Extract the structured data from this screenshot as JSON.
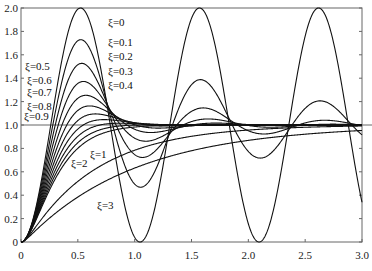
{
  "chart_data": {
    "type": "line",
    "title": "",
    "xlabel": "",
    "ylabel": "",
    "xlim": [
      0,
      3.0
    ],
    "ylim": [
      0,
      2.0
    ],
    "grid": false,
    "legend": "none (inline annotations)",
    "x_ticks": [
      "0",
      "0.5",
      "1.0",
      "1.5",
      "2.0",
      "2.5",
      "3.0"
    ],
    "y_ticks": [
      "0",
      "0.2",
      "0.4",
      "0.6",
      "0.8",
      "1.0",
      "1.2",
      "1.4",
      "1.6",
      "1.8",
      "2.0"
    ],
    "reference_line": {
      "y": 1.0
    },
    "model": "unit step response of second-order system, natural frequency approx 6 rad/s",
    "omega_n": 6.0,
    "series": [
      {
        "name": "ξ=0",
        "zeta": 0,
        "peak": 2.0,
        "label": "ξ=0"
      },
      {
        "name": "ξ=0.1",
        "zeta": 0.1,
        "peak": 1.73,
        "label": "ξ=0.1"
      },
      {
        "name": "ξ=0.2",
        "zeta": 0.2,
        "peak": 1.53,
        "label": "ξ=0.2"
      },
      {
        "name": "ξ=0.3",
        "zeta": 0.3,
        "peak": 1.37,
        "label": "ξ=0.3"
      },
      {
        "name": "ξ=0.4",
        "zeta": 0.4,
        "peak": 1.25,
        "label": "ξ=0.4"
      },
      {
        "name": "ξ=0.5",
        "zeta": 0.5,
        "peak": 1.16,
        "label": "ξ=0.5"
      },
      {
        "name": "ξ=0.6",
        "zeta": 0.6,
        "peak": 1.09,
        "label": "ξ=0.6"
      },
      {
        "name": "ξ=0.7",
        "zeta": 0.7,
        "peak": 1.05,
        "label": "ξ=0.7"
      },
      {
        "name": "ξ=0.8",
        "zeta": 0.8,
        "peak": 1.02,
        "label": "ξ=0.8"
      },
      {
        "name": "ξ=0.9",
        "zeta": 0.9,
        "peak": 1.0,
        "label": "ξ=0.9"
      },
      {
        "name": "ξ=1",
        "zeta": 1,
        "peak": 1.0,
        "label": "ξ=1"
      },
      {
        "name": "ξ=2",
        "zeta": 2,
        "peak": 0.95,
        "label": "ξ=2"
      },
      {
        "name": "ξ=3",
        "zeta": 3,
        "peak": 0.88,
        "label": "ξ=3"
      }
    ]
  },
  "annotations": {
    "z0": "ξ=0",
    "z01": "ξ=0.1",
    "z02": "ξ=0.2",
    "z03": "ξ=0.3",
    "z04": "ξ=0.4",
    "z05": "ξ=0.5",
    "z06": "ξ=0.6",
    "z07": "ξ=0.7",
    "z08": "ξ=0.8",
    "z09": "ξ=0.9",
    "z1": "ξ=1",
    "z2": "ξ=2",
    "z3": "ξ=3"
  },
  "axis": {
    "x": [
      "0",
      "0.5",
      "1.0",
      "1.5",
      "2.0",
      "2.5",
      "3.0"
    ],
    "y": [
      "0",
      "0.2",
      "0.4",
      "0.6",
      "0.8",
      "1.0",
      "1.2",
      "1.4",
      "1.6",
      "1.8",
      "2.0"
    ]
  },
  "colors": {
    "line": "#111111",
    "axis": "#555555",
    "background": "#ffffff"
  }
}
